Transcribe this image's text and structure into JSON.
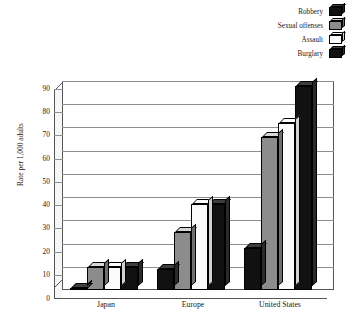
{
  "chart_data": {
    "type": "bar",
    "title": "",
    "subtitle": "",
    "xlabel": "",
    "ylabel": "Rate per 1,000 adults",
    "categories": [
      "Japan",
      "Europe",
      "United States"
    ],
    "series": [
      {
        "name": "Robbery",
        "color": "#111111",
        "values": [
          1,
          9,
          18
        ]
      },
      {
        "name": "Sexual offenses",
        "color": "#8c8c8c",
        "values": [
          10,
          25,
          66
        ]
      },
      {
        "name": "Assault",
        "color": "#fbfbfb",
        "values": [
          10,
          37,
          72
        ]
      },
      {
        "name": "Burglary",
        "color": "#111111",
        "values": [
          10,
          37,
          88
        ]
      }
    ],
    "ylim": [
      0,
      90
    ],
    "ytick_step": 10,
    "yticks": [
      "90",
      "80",
      "70",
      "60",
      "50",
      "40",
      "30",
      "20",
      "10",
      "0"
    ],
    "grid": true,
    "legend_position": "top-right",
    "three_d": true
  },
  "legend": {
    "entries": [
      {
        "label": "Robbery",
        "swatch": "black"
      },
      {
        "label": "Sexual offenses",
        "swatch": "gray"
      },
      {
        "label": "Assault",
        "swatch": "white"
      },
      {
        "label": "Burglary",
        "swatch": "black"
      }
    ]
  }
}
